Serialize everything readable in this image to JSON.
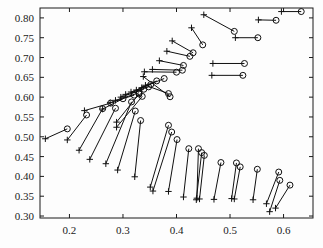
{
  "chart_data": {
    "type": "scatter",
    "title": "",
    "xlabel": "",
    "ylabel": "",
    "xlim": [
      0.145,
      0.655
    ],
    "ylim": [
      0.295,
      0.825
    ],
    "grid": false,
    "legend": null,
    "xticks": [
      0.2,
      0.3,
      0.4,
      0.5,
      0.6
    ],
    "xtick_labels": [
      "0.2",
      "0.3",
      "0.4",
      "0.5",
      "0.6"
    ],
    "yticks": [
      0.3,
      0.35,
      0.4,
      0.45,
      0.5,
      0.55,
      0.6,
      0.65,
      0.7,
      0.75,
      0.8
    ],
    "ytick_labels": [
      "0.30",
      "0.35",
      "0.40",
      "0.45",
      "0.50",
      "0.55",
      "0.60",
      "0.65",
      "0.70",
      "0.75",
      "0.80"
    ],
    "marker_start": "plus",
    "marker_end": "circle",
    "segments": [
      {
        "x0": 0.155,
        "y0": 0.495,
        "x1": 0.196,
        "y1": 0.52
      },
      {
        "x0": 0.196,
        "y0": 0.492,
        "x1": 0.232,
        "y1": 0.555
      },
      {
        "x0": 0.218,
        "y0": 0.466,
        "x1": 0.262,
        "y1": 0.571
      },
      {
        "x0": 0.238,
        "y0": 0.443,
        "x1": 0.286,
        "y1": 0.572
      },
      {
        "x0": 0.228,
        "y0": 0.566,
        "x1": 0.277,
        "y1": 0.585
      },
      {
        "x0": 0.262,
        "y0": 0.57,
        "x1": 0.3,
        "y1": 0.596
      },
      {
        "x0": 0.268,
        "y0": 0.432,
        "x1": 0.316,
        "y1": 0.588
      },
      {
        "x0": 0.276,
        "y0": 0.586,
        "x1": 0.321,
        "y1": 0.605
      },
      {
        "x0": 0.286,
        "y0": 0.592,
        "x1": 0.33,
        "y1": 0.611
      },
      {
        "x0": 0.29,
        "y0": 0.416,
        "x1": 0.323,
        "y1": 0.565
      },
      {
        "x0": 0.288,
        "y0": 0.537,
        "x1": 0.33,
        "y1": 0.608
      },
      {
        "x0": 0.288,
        "y0": 0.524,
        "x1": 0.336,
        "y1": 0.602
      },
      {
        "x0": 0.296,
        "y0": 0.6,
        "x1": 0.339,
        "y1": 0.62
      },
      {
        "x0": 0.305,
        "y0": 0.607,
        "x1": 0.348,
        "y1": 0.626
      },
      {
        "x0": 0.315,
        "y0": 0.613,
        "x1": 0.352,
        "y1": 0.632
      },
      {
        "x0": 0.322,
        "y0": 0.399,
        "x1": 0.333,
        "y1": 0.541
      },
      {
        "x0": 0.325,
        "y0": 0.618,
        "x1": 0.363,
        "y1": 0.641
      },
      {
        "x0": 0.335,
        "y0": 0.624,
        "x1": 0.377,
        "y1": 0.647
      },
      {
        "x0": 0.338,
        "y0": 0.652,
        "x1": 0.388,
        "y1": 0.601
      },
      {
        "x0": 0.342,
        "y0": 0.63,
        "x1": 0.385,
        "y1": 0.609
      },
      {
        "x0": 0.351,
        "y0": 0.373,
        "x1": 0.385,
        "y1": 0.529
      },
      {
        "x0": 0.356,
        "y0": 0.363,
        "x1": 0.391,
        "y1": 0.512
      },
      {
        "x0": 0.34,
        "y0": 0.664,
        "x1": 0.4,
        "y1": 0.663
      },
      {
        "x0": 0.355,
        "y0": 0.67,
        "x1": 0.411,
        "y1": 0.668
      },
      {
        "x0": 0.368,
        "y0": 0.692,
        "x1": 0.413,
        "y1": 0.68
      },
      {
        "x0": 0.385,
        "y0": 0.362,
        "x1": 0.401,
        "y1": 0.493
      },
      {
        "x0": 0.382,
        "y0": 0.716,
        "x1": 0.425,
        "y1": 0.703
      },
      {
        "x0": 0.392,
        "y0": 0.742,
        "x1": 0.431,
        "y1": 0.712
      },
      {
        "x0": 0.413,
        "y0": 0.348,
        "x1": 0.423,
        "y1": 0.47
      },
      {
        "x0": 0.438,
        "y0": 0.345,
        "x1": 0.441,
        "y1": 0.47
      },
      {
        "x0": 0.437,
        "y0": 0.341,
        "x1": 0.447,
        "y1": 0.46
      },
      {
        "x0": 0.428,
        "y0": 0.775,
        "x1": 0.449,
        "y1": 0.732
      },
      {
        "x0": 0.443,
        "y0": 0.343,
        "x1": 0.452,
        "y1": 0.453
      },
      {
        "x0": 0.47,
        "y0": 0.342,
        "x1": 0.483,
        "y1": 0.435
      },
      {
        "x0": 0.451,
        "y0": 0.808,
        "x1": 0.508,
        "y1": 0.766
      },
      {
        "x0": 0.468,
        "y0": 0.685,
        "x1": 0.527,
        "y1": 0.685
      },
      {
        "x0": 0.466,
        "y0": 0.655,
        "x1": 0.524,
        "y1": 0.655
      },
      {
        "x0": 0.503,
        "y0": 0.344,
        "x1": 0.512,
        "y1": 0.434
      },
      {
        "x0": 0.508,
        "y0": 0.343,
        "x1": 0.519,
        "y1": 0.424
      },
      {
        "x0": 0.51,
        "y0": 0.75,
        "x1": 0.552,
        "y1": 0.75
      },
      {
        "x0": 0.543,
        "y0": 0.341,
        "x1": 0.551,
        "y1": 0.418
      },
      {
        "x0": 0.553,
        "y0": 0.795,
        "x1": 0.586,
        "y1": 0.794
      },
      {
        "x0": 0.568,
        "y0": 0.331,
        "x1": 0.591,
        "y1": 0.411
      },
      {
        "x0": 0.574,
        "y0": 0.311,
        "x1": 0.593,
        "y1": 0.39
      },
      {
        "x0": 0.585,
        "y0": 0.32,
        "x1": 0.612,
        "y1": 0.378
      },
      {
        "x0": 0.596,
        "y0": 0.816,
        "x1": 0.633,
        "y1": 0.816
      }
    ]
  },
  "plot_area": {
    "left_px": 40,
    "right_px": 313,
    "top_px": 8,
    "bottom_px": 218
  },
  "colors": {
    "axis": "#1a1a1a",
    "marker": "#101010",
    "background": "#fdfdfd"
  }
}
